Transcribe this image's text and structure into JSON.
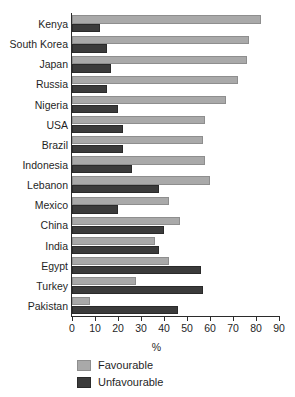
{
  "chart_data": {
    "type": "bar",
    "orientation": "horizontal",
    "title": "",
    "xlabel": "%",
    "ylabel": "",
    "xlim": [
      0,
      90
    ],
    "xticks": [
      0,
      10,
      20,
      30,
      40,
      50,
      60,
      70,
      80,
      90
    ],
    "grid": false,
    "legend_position": "bottom-left",
    "categories": [
      "Kenya",
      "South Korea",
      "Japan",
      "Russia",
      "Nigeria",
      "USA",
      "Brazil",
      "Indonesia",
      "Lebanon",
      "Mexico",
      "China",
      "India",
      "Egypt",
      "Turkey",
      "Pakistan"
    ],
    "series": [
      {
        "name": "Favourable",
        "color": "#a9a9a9",
        "values": [
          82,
          77,
          76,
          72,
          67,
          58,
          57,
          58,
          60,
          42,
          47,
          36,
          42,
          28,
          8
        ]
      },
      {
        "name": "Unfavourable",
        "color": "#3b3b3b",
        "values": [
          12,
          15,
          17,
          15,
          20,
          22,
          22,
          26,
          38,
          20,
          40,
          38,
          56,
          57,
          46
        ]
      }
    ]
  },
  "legend": {
    "items": [
      {
        "label": "Favourable",
        "swatch": "fav"
      },
      {
        "label": "Unfavourable",
        "swatch": "unfav"
      }
    ]
  },
  "axis": {
    "x_title": "%"
  }
}
